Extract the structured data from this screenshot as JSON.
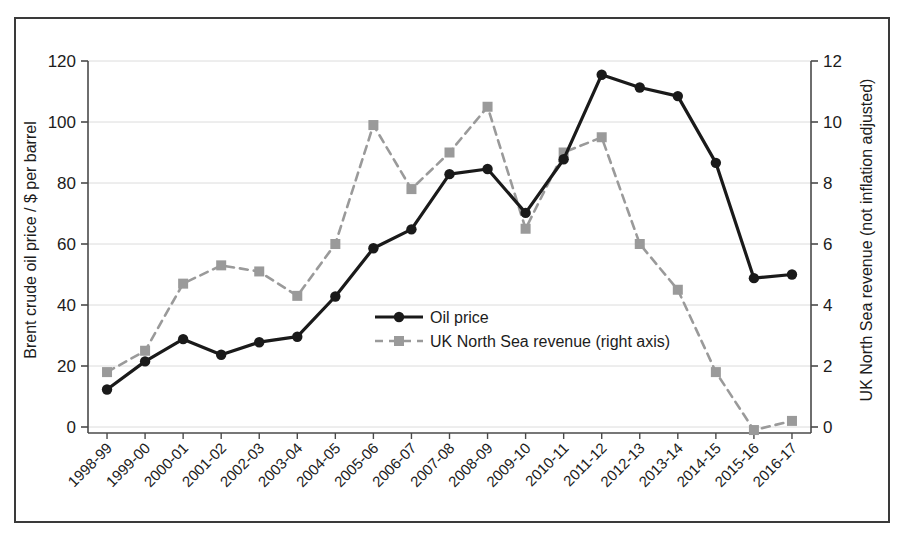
{
  "chart_data": {
    "type": "line",
    "title": "",
    "subtitle": "",
    "xlabel": "",
    "ylabel": "Brent crude oil price / $ per barrel",
    "y2label": "UK North Sea revenue (not inflation adjusted)",
    "grid": true,
    "legend_position": "center",
    "categories": [
      "1998-99",
      "1999-00",
      "2000-01",
      "2001-02",
      "2002-03",
      "2003-04",
      "2004-05",
      "2005-06",
      "2006-07",
      "2007-08",
      "2008-09",
      "2009-10",
      "2010-11",
      "2011-12",
      "2012-13",
      "2013-14",
      "2014-15",
      "2015-16",
      "2016-17"
    ],
    "ylim": [
      0,
      120
    ],
    "yticks": [
      0,
      20,
      40,
      60,
      80,
      100,
      120
    ],
    "ytick_labels": [
      "0",
      "20",
      "40",
      "60",
      "80",
      "100",
      "120"
    ],
    "y2lim": [
      0,
      12
    ],
    "y2ticks": [
      0,
      2,
      4,
      6,
      8,
      10,
      12
    ],
    "y2tick_labels": [
      "0",
      "2",
      "4",
      "6",
      "8",
      "10",
      "12"
    ],
    "series": [
      {
        "name": "Oil price",
        "axis": "left",
        "style": "solid",
        "marker": "circle",
        "color": "#1a1a1a",
        "values": [
          12.3,
          21.5,
          28.8,
          23.7,
          27.8,
          29.6,
          42.8,
          58.6,
          64.8,
          82.9,
          84.6,
          70.2,
          87.8,
          115.5,
          111.3,
          108.5,
          86.6,
          48.8,
          50.0
        ]
      },
      {
        "name": "UK North Sea revenue (right axis)",
        "axis": "right",
        "style": "dashed",
        "marker": "square",
        "color": "#9a9a9a",
        "values": [
          1.8,
          2.5,
          4.7,
          5.3,
          5.1,
          4.3,
          6.0,
          9.9,
          7.8,
          9.0,
          10.5,
          6.5,
          9.0,
          9.5,
          6.0,
          4.5,
          1.8,
          -0.1,
          0.2
        ]
      }
    ]
  },
  "legend": {
    "entries": [
      {
        "label": "Oil price"
      },
      {
        "label": "UK North Sea revenue (right axis)"
      }
    ]
  },
  "colors": {
    "oil_price": "#1a1a1a",
    "revenue": "#9a9a9a",
    "gridline": "#dcdcdc",
    "axis": "#4a4a4a",
    "frame": "#3a3a3a",
    "background": "#ffffff"
  }
}
